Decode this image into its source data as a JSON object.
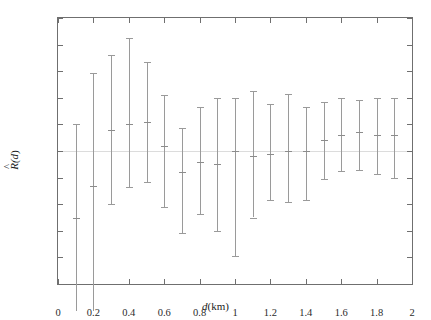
{
  "chart_data": {
    "type": "scatter",
    "title": "",
    "xlabel": "d(km)",
    "ylabel": "R̂(d)",
    "xlim": [
      0,
      2
    ],
    "ylim": [
      -0.5,
      0.5
    ],
    "xticks": [
      "0",
      "0.2",
      "0.4",
      "0.6",
      "0.8",
      "1",
      "1.2",
      "1.4",
      "1.6",
      "1.8",
      "2"
    ],
    "xtick_values": [
      0,
      0.2,
      0.4,
      0.6,
      0.8,
      1.0,
      1.2,
      1.4,
      1.6,
      1.8,
      2.0
    ],
    "yticks": [
      "0.5",
      "0.4",
      "0.3",
      "0.2",
      "0.1",
      "0",
      "-0.1",
      "-0.2",
      "-0.3",
      "-0.4",
      "-0.5"
    ],
    "ytick_values": [
      0.5,
      0.4,
      0.3,
      0.2,
      0.1,
      0,
      -0.1,
      -0.2,
      -0.3,
      -0.4,
      -0.5
    ],
    "grid": false,
    "legend": null,
    "zero_reference_line": 0,
    "series": [
      {
        "name": "R̂(d) with error bars",
        "x": [
          0.1,
          0.2,
          0.3,
          0.4,
          0.5,
          0.6,
          0.7,
          0.8,
          0.9,
          1.0,
          1.1,
          1.2,
          1.3,
          1.4,
          1.5,
          1.6,
          1.7,
          1.8,
          1.9
        ],
        "y": [
          -0.25,
          -0.13,
          0.08,
          0.1,
          0.11,
          0.02,
          -0.08,
          -0.04,
          -0.05,
          0.0,
          -0.02,
          -0.01,
          0.0,
          0.0,
          0.04,
          0.06,
          0.07,
          0.06,
          0.06
        ],
        "ymax": [
          0.1,
          0.295,
          0.36,
          0.425,
          0.335,
          0.21,
          0.085,
          0.165,
          0.2,
          0.2,
          0.225,
          0.175,
          0.215,
          0.165,
          0.185,
          0.2,
          0.19,
          0.2,
          0.2
        ],
        "ymin": [
          -0.6,
          -0.6,
          -0.2,
          -0.135,
          -0.115,
          -0.21,
          -0.31,
          -0.235,
          -0.3,
          -0.395,
          -0.25,
          -0.185,
          -0.19,
          -0.185,
          -0.105,
          -0.075,
          -0.07,
          -0.085,
          -0.1
        ]
      }
    ],
    "colors": {
      "marker": "#9a9a9a",
      "errorbar": "#9a9a9a",
      "axis": "#6f6f6f",
      "zero_line": "#dcdcdc",
      "text": "#1c1c1c",
      "background": "#ffffff"
    }
  }
}
